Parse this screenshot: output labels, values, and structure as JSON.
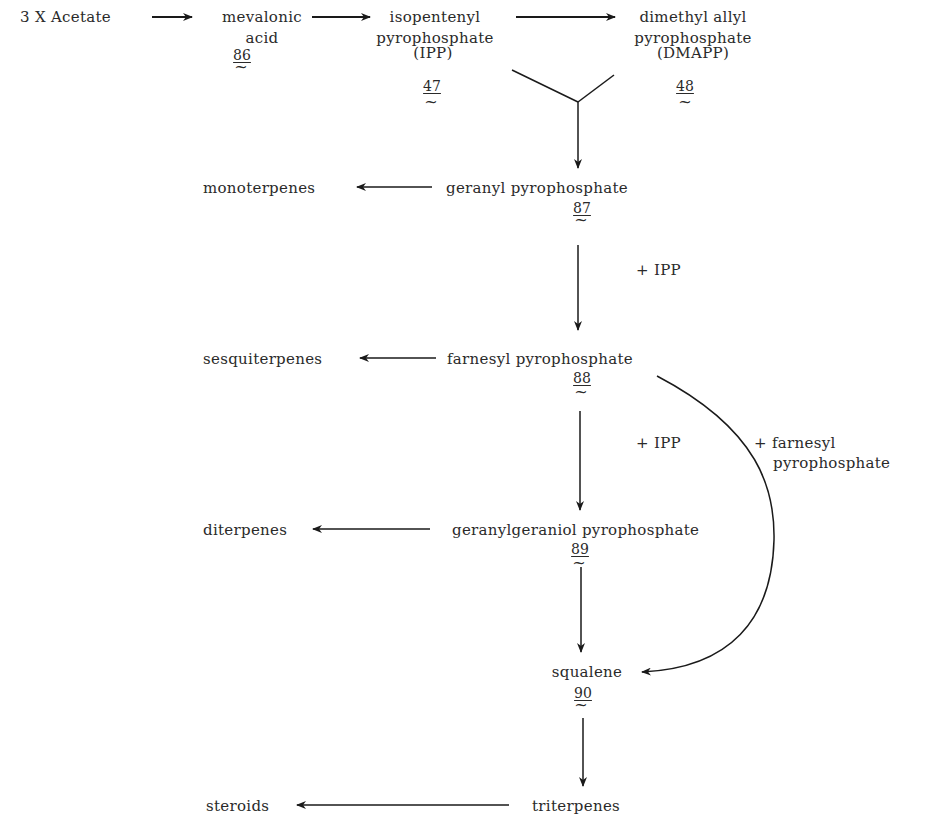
{
  "diagram": {
    "nodes": {
      "acetate": {
        "label": "3 X Acetate"
      },
      "mevalonic": {
        "line1": "mevalonic",
        "line2": "acid",
        "number": "86"
      },
      "ipp": {
        "line1": "isopentenyl",
        "line2": "pyrophosphate",
        "line3": "(IPP)",
        "number": "47"
      },
      "dmapp": {
        "line1": "dimethyl allyl",
        "line2": "pyrophosphate",
        "line3": "(DMAPP)",
        "number": "48"
      },
      "geranyl": {
        "label": "geranyl pyrophosphate",
        "number": "87"
      },
      "monoterpenes": {
        "label": "monoterpenes"
      },
      "farnesyl": {
        "label": "farnesyl pyrophosphate",
        "number": "88"
      },
      "sesquiterpenes": {
        "label": "sesquiterpenes"
      },
      "geranylgeraniol": {
        "label": "geranylgeraniol pyrophosphate",
        "number": "89"
      },
      "diterpenes": {
        "label": "diterpenes"
      },
      "squalene": {
        "label": "squalene",
        "number": "90"
      },
      "triterpenes": {
        "label": "triterpenes"
      },
      "steroids": {
        "label": "steroids"
      }
    },
    "annotations": {
      "plus_ipp_1": "+ IPP",
      "plus_ipp_2": "+ IPP",
      "plus_farnesyl_line1": "+ farnesyl",
      "plus_farnesyl_line2": "pyrophosphate"
    },
    "tilde_glyph": "~",
    "line_color": "#1a1a1a"
  }
}
